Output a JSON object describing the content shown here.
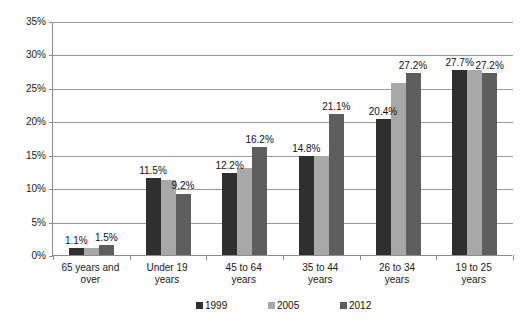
{
  "chart_data": {
    "type": "bar",
    "title": "",
    "subtitle": "",
    "xlabel": "",
    "ylabel": "",
    "ylim": [
      0,
      35
    ],
    "y_tick_labels": [
      "0%",
      "5%",
      "10%",
      "15%",
      "20%",
      "25%",
      "30%",
      "35%"
    ],
    "y_tick_values": [
      0,
      5,
      10,
      15,
      20,
      25,
      30,
      35
    ],
    "grid": true,
    "legend_position": "bottom",
    "categories": [
      "65 years and over",
      "Under 19 years",
      "45 to 64 years",
      "35 to 44 years",
      "26 to 34 years",
      "19 to 25 years"
    ],
    "category_lines": [
      [
        "65 years and",
        "over"
      ],
      [
        "Under 19",
        "years"
      ],
      [
        "45 to 64",
        "years"
      ],
      [
        "35 to 44",
        "years"
      ],
      [
        "26 to 34",
        "years"
      ],
      [
        "19 to 25",
        "years"
      ]
    ],
    "series": [
      {
        "name": "1999",
        "color": "#2f2f2f",
        "values": [
          1.1,
          11.5,
          12.2,
          14.8,
          20.4,
          27.7
        ]
      },
      {
        "name": "2005",
        "color": "#a8a8a8",
        "values": [
          1.1,
          11.2,
          13.0,
          14.8,
          25.8,
          27.7
        ]
      },
      {
        "name": "2012",
        "color": "#5e5e5e",
        "values": [
          1.5,
          9.2,
          16.2,
          21.1,
          27.2,
          27.2
        ]
      }
    ],
    "data_labels": [
      {
        "text": "1.1%",
        "category": 0,
        "series": 0
      },
      {
        "text": "1.5%",
        "category": 0,
        "series": 2
      },
      {
        "text": "11.5%",
        "category": 1,
        "series": 0
      },
      {
        "text": "9.2%",
        "category": 1,
        "series": 2
      },
      {
        "text": "12.2%",
        "category": 2,
        "series": 0
      },
      {
        "text": "16.2%",
        "category": 2,
        "series": 2
      },
      {
        "text": "14.8%",
        "category": 3,
        "series": 0
      },
      {
        "text": "21.1%",
        "category": 3,
        "series": 2
      },
      {
        "text": "20.4%",
        "category": 4,
        "series": 0
      },
      {
        "text": "27.2%",
        "category": 4,
        "series": 2
      },
      {
        "text": "27.7%",
        "category": 5,
        "series": 0
      },
      {
        "text": "27.2%",
        "category": 5,
        "series": 2
      }
    ]
  },
  "legend": {
    "items": [
      {
        "label": "1999",
        "color": "#2f2f2f"
      },
      {
        "label": "2005",
        "color": "#a8a8a8"
      },
      {
        "label": "2012",
        "color": "#5e5e5e"
      }
    ]
  }
}
